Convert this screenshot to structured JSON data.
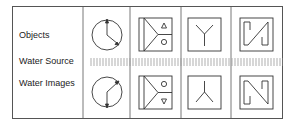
{
  "rows": {
    "objects": "Objects",
    "water_source": "Water Source",
    "water_images": "Water Images"
  },
  "columns": [
    {
      "id": "clock",
      "object": "clock-hands-icon",
      "image": "clock-hands-reflected-icon"
    },
    {
      "id": "triangle-circle",
      "object": "arrow-box-triangle-circle-icon",
      "image": "arrow-box-circle-triangle-icon"
    },
    {
      "id": "y-shape",
      "object": "y-shape-icon",
      "image": "inverted-y-shape-icon"
    },
    {
      "id": "n-shape",
      "object": "n-shape-icon",
      "image": "n-shape-reflected-icon"
    }
  ],
  "colors": {
    "line": "#444444",
    "water": "#999999"
  }
}
